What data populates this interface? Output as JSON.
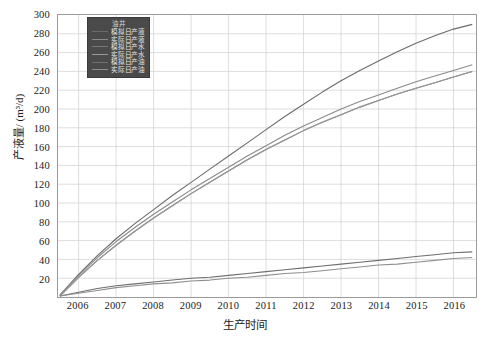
{
  "chart_data": {
    "type": "line",
    "title": "",
    "xlabel": "生产时间",
    "ylabel": "产液量/ (m³/d)",
    "legend_title": "油井",
    "legend_position": "upper-left-inside",
    "grid": true,
    "xlim": [
      2005.45,
      2016.6
    ],
    "ylim": [
      0,
      300
    ],
    "yticks": [
      0,
      20,
      40,
      60,
      80,
      100,
      120,
      140,
      160,
      180,
      200,
      220,
      240,
      260,
      280,
      300
    ],
    "ytick_labels": [
      "0",
      "20",
      "40",
      "60",
      "80",
      "100",
      "120",
      "140",
      "160",
      "180",
      "200",
      "220",
      "240",
      "260",
      "280",
      "300"
    ],
    "xticks": [
      2006,
      2007,
      2008,
      2009,
      2010,
      2011,
      2012,
      2013,
      2014,
      2015,
      2016
    ],
    "xtick_labels": [
      "2006",
      "2007",
      "2008",
      "2009",
      "2010",
      "2011",
      "2012",
      "2013",
      "2014",
      "2015",
      "2016"
    ],
    "x": [
      2005.5,
      2006,
      2006.5,
      2007,
      2007.5,
      2008,
      2008.5,
      2009,
      2009.5,
      2010,
      2010.5,
      2011,
      2011.5,
      2012,
      2012.5,
      2013,
      2013.5,
      2014,
      2014.5,
      2015,
      2015.5,
      2016,
      2016.5
    ],
    "series": [
      {
        "name": "模拟日产液",
        "color": "#6b6b6b",
        "values": [
          2,
          24,
          44,
          62,
          78,
          93,
          108,
          122,
          136,
          150,
          164,
          178,
          192,
          205,
          218,
          230,
          241,
          251,
          261,
          270,
          278,
          285,
          290
        ]
      },
      {
        "name": "实际日产液",
        "color": "#8a8a8a",
        "values": [
          2,
          23,
          42,
          59,
          74,
          88,
          101,
          114,
          126,
          138,
          150,
          161,
          172,
          182,
          191,
          200,
          208,
          215,
          222,
          229,
          235,
          241,
          247
        ]
      },
      {
        "name": "模拟日产水",
        "color": "#7a7a7a",
        "values": [
          1,
          21,
          39,
          55,
          70,
          84,
          97,
          110,
          122,
          134,
          146,
          157,
          167,
          177,
          186,
          194,
          202,
          209,
          216,
          222,
          228,
          234,
          240
        ]
      },
      {
        "name": "实际日产水",
        "color": "#9a9a9a",
        "values": [
          1,
          21,
          39,
          55,
          70,
          84,
          97,
          110,
          122,
          134,
          146,
          157,
          167,
          177,
          186,
          194,
          202,
          209,
          216,
          222,
          228,
          234,
          240
        ]
      },
      {
        "name": "模拟日产油",
        "color": "#6f6f6f",
        "values": [
          1,
          5,
          9,
          12,
          14,
          16,
          18,
          20,
          21,
          23,
          25,
          27,
          29,
          31,
          33,
          35,
          37,
          39,
          41,
          43,
          45,
          47,
          48
        ]
      },
      {
        "name": "实际日产油",
        "color": "#8f8f8f",
        "values": [
          1,
          4,
          7,
          10,
          12,
          14,
          15,
          17,
          18,
          20,
          21,
          23,
          25,
          26,
          28,
          30,
          32,
          34,
          35,
          37,
          39,
          41,
          42
        ]
      }
    ]
  },
  "legend_entries": [
    {
      "label": "模拟日产液"
    },
    {
      "label": "实际日产液"
    },
    {
      "label": "模拟日产水"
    },
    {
      "label": "实际日产水"
    },
    {
      "label": "模拟日产油"
    },
    {
      "label": "实际日产油"
    }
  ]
}
